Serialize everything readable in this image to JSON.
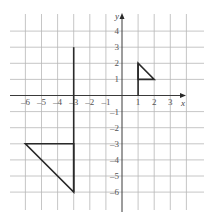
{
  "diagram": {
    "type": "coordinate-grid",
    "axes": {
      "x_label": "x",
      "y_label": "y",
      "x_range": [
        -6,
        3
      ],
      "y_range": [
        -6,
        4
      ],
      "x_ticks": [
        "–6",
        "–5",
        "–4",
        "–3",
        "–2",
        "–1",
        "1",
        "2",
        "3"
      ],
      "x_tick_values": [
        -6,
        -5,
        -4,
        -3,
        -2,
        -1,
        1,
        2,
        3
      ],
      "y_ticks": [
        "4",
        "3",
        "2",
        "1",
        "–1",
        "–2",
        "–3",
        "–4",
        "–5",
        "–6"
      ],
      "y_tick_values": [
        4,
        3,
        2,
        1,
        -1,
        -2,
        -3,
        -4,
        -5,
        -6
      ]
    },
    "grid": {
      "x_lines": [
        -6,
        -5,
        -4,
        -3,
        -2,
        -1,
        0,
        1,
        2,
        3,
        4
      ],
      "y_lines": [
        4,
        3,
        2,
        1,
        0,
        -1,
        -2,
        -3,
        -4,
        -5,
        -6
      ],
      "color": "#b8b8b8"
    },
    "shapes": [
      {
        "name": "large-triangle",
        "vertices": [
          [
            -6,
            -3
          ],
          [
            -3,
            -3
          ],
          [
            -3,
            -6
          ]
        ]
      },
      {
        "name": "mirror-line-x-neg3",
        "segment": [
          [
            -3,
            3
          ],
          [
            -3,
            -6
          ]
        ]
      },
      {
        "name": "small-triangle",
        "vertices": [
          [
            1,
            2
          ],
          [
            1,
            1
          ],
          [
            2,
            1
          ]
        ]
      },
      {
        "name": "small-line-x1",
        "segment": [
          [
            1,
            2
          ],
          [
            1,
            0
          ]
        ]
      }
    ],
    "colors": {
      "shape_stroke": "#2a2a2a",
      "axis": "#3a3a3a",
      "labels": "#555555"
    }
  }
}
